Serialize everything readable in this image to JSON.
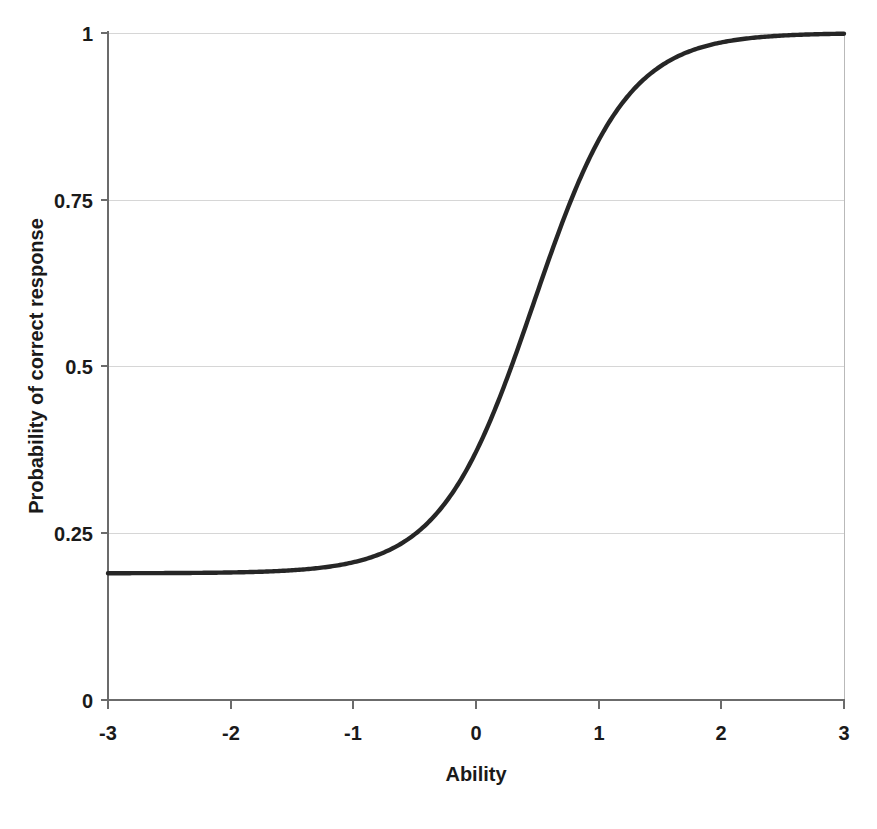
{
  "chart_data": {
    "type": "line",
    "title": "",
    "subtitle": "",
    "xlabel": "Ability",
    "ylabel": "Probability of correct response",
    "xlim": [
      -3,
      3
    ],
    "ylim": [
      0,
      1
    ],
    "x_ticks": [
      "-3",
      "-2",
      "-1",
      "0",
      "1",
      "2",
      "3"
    ],
    "x_tick_values": [
      -3,
      -2,
      -1,
      0,
      1,
      2,
      3
    ],
    "y_ticks": [
      "0",
      "0.25",
      "0.5",
      "0.75",
      "1"
    ],
    "y_tick_values": [
      0,
      0.25,
      0.5,
      0.75,
      1
    ],
    "grid": "horizontal",
    "legend": "none",
    "annotations": [],
    "curve_color": "#262626",
    "grid_color": "#d6d6d6",
    "axis_color": "#6b6b6b",
    "model": "3PL item characteristic curve",
    "parameters": {
      "lower_asymptote_c": 0.19,
      "difficulty_b": 0.47,
      "discrimination_a": 1.55
    },
    "series": [
      {
        "name": "Item characteristic curve",
        "x": [
          -3,
          -2.8,
          -2.6,
          -2.4,
          -2.2,
          -2,
          -1.8,
          -1.6,
          -1.4,
          -1.2,
          -1,
          -0.8,
          -0.6,
          -0.4,
          -0.2,
          0,
          0.2,
          0.4,
          0.6,
          0.8,
          1,
          1.2,
          1.4,
          1.6,
          1.8,
          2,
          2.2,
          2.4,
          2.6,
          2.8,
          3
        ],
        "y": [
          0.19,
          0.191,
          0.192,
          0.193,
          0.195,
          0.197,
          0.2,
          0.204,
          0.21,
          0.218,
          0.229,
          0.244,
          0.265,
          0.293,
          0.331,
          0.379,
          0.436,
          0.5,
          0.567,
          0.633,
          0.694,
          0.747,
          0.792,
          0.829,
          0.858,
          0.882,
          0.9,
          0.915,
          0.926,
          0.935,
          0.942
        ]
      }
    ]
  },
  "axes": {
    "y_labels": [
      {
        "text": "1",
        "value": 1
      },
      {
        "text": "0.75",
        "value": 0.75
      },
      {
        "text": "0.5",
        "value": 0.5
      },
      {
        "text": "0.25",
        "value": 0.25
      },
      {
        "text": "0",
        "value": 0
      }
    ],
    "x_labels": [
      {
        "text": "-3",
        "value": -3
      },
      {
        "text": "-2",
        "value": -2
      },
      {
        "text": "-1",
        "value": -1
      },
      {
        "text": "0",
        "value": 0
      },
      {
        "text": "1",
        "value": 1
      },
      {
        "text": "2",
        "value": 2
      },
      {
        "text": "3",
        "value": 3
      }
    ],
    "x_axis_title": "Ability",
    "y_axis_title": "Probability of correct response"
  }
}
